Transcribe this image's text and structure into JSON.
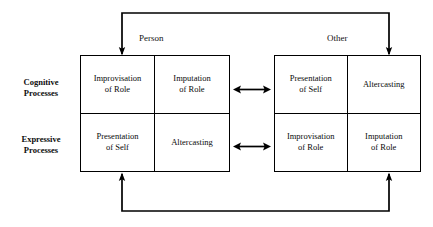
{
  "diagram": {
    "type": "two-by-two matrix with feedback loops",
    "columns": [
      {
        "id": "person",
        "label": "Person"
      },
      {
        "id": "other",
        "label": "Other"
      }
    ],
    "rows": [
      {
        "id": "cognitive",
        "line1": "Cognitive",
        "line2": "Processes"
      },
      {
        "id": "expressive",
        "line1": "Expressive",
        "line2": "Processes"
      }
    ],
    "matrices": {
      "person": {
        "cells": [
          {
            "id": "person-cognitive-1",
            "line1": "Improvisation",
            "line2": "of Role"
          },
          {
            "id": "person-cognitive-2",
            "line1": "Imputation",
            "line2": "of Role"
          },
          {
            "id": "person-expressive-1",
            "line1": "Presentation",
            "line2": "of Self"
          },
          {
            "id": "person-expressive-2",
            "line1": "Altercasting",
            "line2": ""
          }
        ]
      },
      "other": {
        "cells": [
          {
            "id": "other-cognitive-1",
            "line1": "Presentation",
            "line2": "of Self"
          },
          {
            "id": "other-cognitive-2",
            "line1": "Altercasting",
            "line2": ""
          },
          {
            "id": "other-expressive-1",
            "line1": "Improvisation",
            "line2": "of Role"
          },
          {
            "id": "other-expressive-2",
            "line1": "Imputation",
            "line2": "of Role"
          }
        ]
      }
    },
    "connectors": {
      "cognitive_link": "double-headed-arrow",
      "expressive_link": "double-headed-arrow",
      "top_loop": "bracket with downward arrows into both matrices",
      "bottom_loop": "bracket with upward arrows into both matrices"
    },
    "colors": {
      "stroke": "#000000",
      "text": "#000000",
      "background": "#ffffff"
    }
  }
}
